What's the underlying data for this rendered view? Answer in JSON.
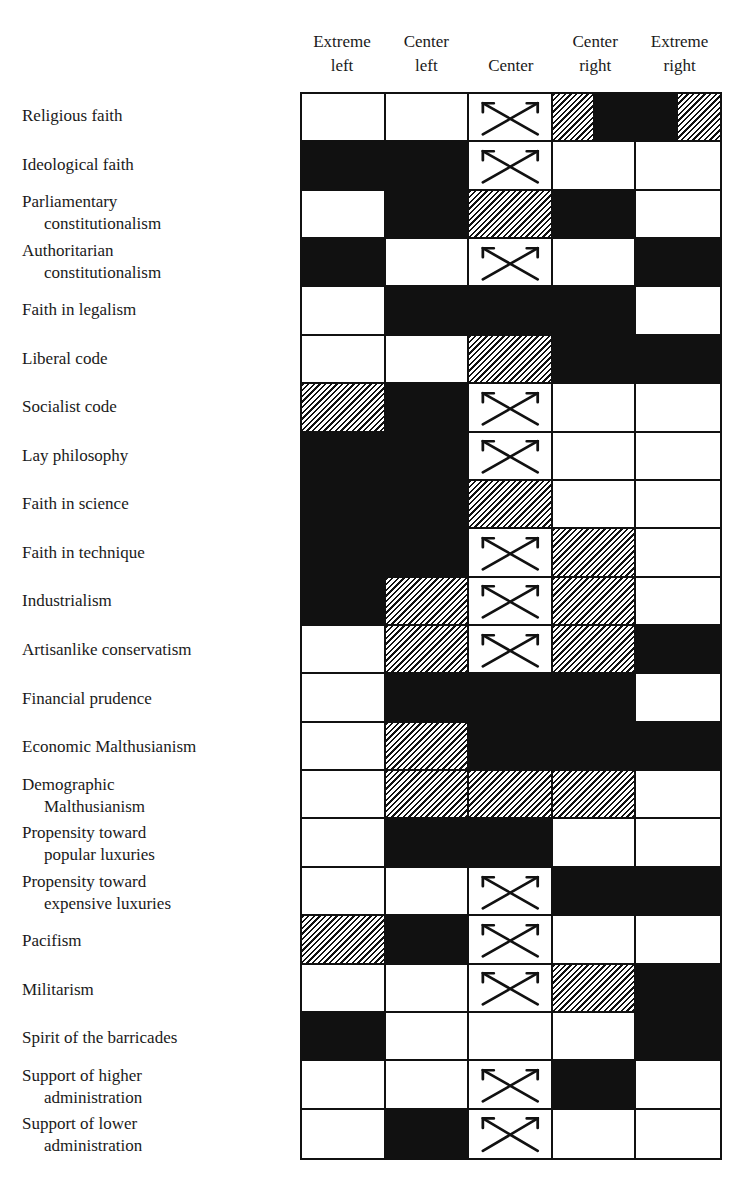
{
  "columns": [
    "Extreme\nleft",
    "Center\nleft",
    "Center",
    "Center\nright",
    "Extreme\nright"
  ],
  "column_headers": [
    {
      "line1": "Extreme",
      "line2": "left"
    },
    {
      "line1": "Center",
      "line2": "left"
    },
    {
      "line1": "",
      "line2": "Center"
    },
    {
      "line1": "Center",
      "line2": "right"
    },
    {
      "line1": "Extreme",
      "line2": "right"
    }
  ],
  "legend_codes": {
    "W": "white (blank)",
    "B": "solid black",
    "H": "hatched",
    "X": "crossed arrows",
    "RF": "left half hatched, right half black",
    "FR": "left half black, right half hatched"
  },
  "colors": {
    "ink": "#111111",
    "paper": "#ffffff"
  },
  "rows": [
    {
      "label1": "Religious faith",
      "label2": "",
      "cells": [
        "W",
        "W",
        "X",
        "RF",
        "FR"
      ]
    },
    {
      "label1": "Ideological faith",
      "label2": "",
      "cells": [
        "B",
        "B",
        "X",
        "W",
        "W"
      ]
    },
    {
      "label1": "Parliamentary",
      "label2": "constitutionalism",
      "cells": [
        "W",
        "B",
        "H",
        "B",
        "W"
      ]
    },
    {
      "label1": "Authoritarian",
      "label2": "constitutionalism",
      "cells": [
        "B",
        "W",
        "X",
        "W",
        "B"
      ]
    },
    {
      "label1": "Faith in legalism",
      "label2": "",
      "cells": [
        "W",
        "B",
        "B",
        "B",
        "W"
      ]
    },
    {
      "label1": "Liberal code",
      "label2": "",
      "cells": [
        "W",
        "W",
        "H",
        "B",
        "B"
      ]
    },
    {
      "label1": "Socialist code",
      "label2": "",
      "cells": [
        "H",
        "B",
        "X",
        "W",
        "W"
      ]
    },
    {
      "label1": "Lay philosophy",
      "label2": "",
      "cells": [
        "B",
        "B",
        "X",
        "W",
        "W"
      ]
    },
    {
      "label1": "Faith in science",
      "label2": "",
      "cells": [
        "B",
        "B",
        "H",
        "W",
        "W"
      ]
    },
    {
      "label1": "Faith in technique",
      "label2": "",
      "cells": [
        "B",
        "B",
        "X",
        "H",
        "W"
      ]
    },
    {
      "label1": "Industrialism",
      "label2": "",
      "cells": [
        "B",
        "H",
        "X",
        "H",
        "W"
      ]
    },
    {
      "label1": "Artisanlike conservatism",
      "label2": "",
      "cells": [
        "W",
        "H",
        "X",
        "H",
        "B"
      ]
    },
    {
      "label1": "Financial prudence",
      "label2": "",
      "cells": [
        "W",
        "B",
        "B",
        "B",
        "W"
      ]
    },
    {
      "label1": "Economic Malthusianism",
      "label2": "",
      "cells": [
        "W",
        "H",
        "B",
        "B",
        "B"
      ]
    },
    {
      "label1": "Demographic",
      "label2": "Malthusianism",
      "cells": [
        "W",
        "H",
        "H",
        "H",
        "W"
      ]
    },
    {
      "label1": "Propensity toward",
      "label2": "popular luxuries",
      "cells": [
        "W",
        "B",
        "B",
        "W",
        "W"
      ]
    },
    {
      "label1": "Propensity toward",
      "label2": "expensive luxuries",
      "cells": [
        "W",
        "W",
        "X",
        "B",
        "B"
      ]
    },
    {
      "label1": "Pacifism",
      "label2": "",
      "cells": [
        "H",
        "B",
        "X",
        "W",
        "W"
      ]
    },
    {
      "label1": "Militarism",
      "label2": "",
      "cells": [
        "W",
        "W",
        "X",
        "H",
        "B"
      ]
    },
    {
      "label1": "Spirit of the barricades",
      "label2": "",
      "cells": [
        "B",
        "W",
        "W",
        "W",
        "B"
      ]
    },
    {
      "label1": "Support of higher",
      "label2": "administration",
      "cells": [
        "W",
        "W",
        "X",
        "B",
        "W"
      ]
    },
    {
      "label1": "Support of lower",
      "label2": "administration",
      "cells": [
        "W",
        "B",
        "X",
        "W",
        "W"
      ]
    }
  ]
}
